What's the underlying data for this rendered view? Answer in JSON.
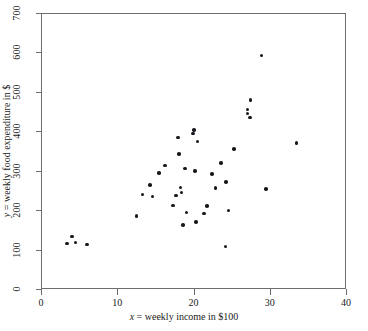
{
  "chart_data": {
    "type": "scatter",
    "title": "",
    "xlabel": "x = weekly income in $100",
    "ylabel": "y = weekly food expenditure in $",
    "xlim": [
      0,
      40
    ],
    "ylim": [
      0,
      700
    ],
    "xticks": [
      0,
      10,
      20,
      30,
      40
    ],
    "yticks": [
      0,
      100,
      200,
      300,
      400,
      500,
      600,
      700
    ],
    "xtick_labels": [
      "0",
      "10",
      "20",
      "30",
      "40"
    ],
    "ytick_labels": [
      "0",
      "100",
      "200",
      "300",
      "400",
      "500",
      "600",
      "700"
    ],
    "grid": false,
    "legend": null,
    "marker": "filled-circle",
    "marker_color": "#16181c",
    "frame_color": "#6d6d6d",
    "points": [
      {
        "x": 3.4,
        "y": 115
      },
      {
        "x": 4.1,
        "y": 133
      },
      {
        "x": 4.5,
        "y": 118
      },
      {
        "x": 6.0,
        "y": 113
      },
      {
        "x": 12.5,
        "y": 185
      },
      {
        "x": 13.3,
        "y": 240
      },
      {
        "x": 14.3,
        "y": 264
      },
      {
        "x": 14.6,
        "y": 235
      },
      {
        "x": 15.5,
        "y": 294
      },
      {
        "x": 16.3,
        "y": 313
      },
      {
        "x": 17.3,
        "y": 212
      },
      {
        "x": 17.7,
        "y": 237
      },
      {
        "x": 18.0,
        "y": 384
      },
      {
        "x": 18.1,
        "y": 342
      },
      {
        "x": 18.3,
        "y": 257
      },
      {
        "x": 18.4,
        "y": 245
      },
      {
        "x": 18.6,
        "y": 163
      },
      {
        "x": 18.9,
        "y": 306
      },
      {
        "x": 19.1,
        "y": 194
      },
      {
        "x": 19.9,
        "y": 394
      },
      {
        "x": 20.1,
        "y": 404
      },
      {
        "x": 20.2,
        "y": 300
      },
      {
        "x": 20.3,
        "y": 170
      },
      {
        "x": 20.5,
        "y": 374
      },
      {
        "x": 21.4,
        "y": 192
      },
      {
        "x": 21.8,
        "y": 211
      },
      {
        "x": 22.4,
        "y": 291
      },
      {
        "x": 22.9,
        "y": 256
      },
      {
        "x": 23.6,
        "y": 320
      },
      {
        "x": 24.2,
        "y": 108
      },
      {
        "x": 24.3,
        "y": 272
      },
      {
        "x": 24.6,
        "y": 199
      },
      {
        "x": 25.3,
        "y": 355
      },
      {
        "x": 27.1,
        "y": 455
      },
      {
        "x": 27.1,
        "y": 445
      },
      {
        "x": 27.4,
        "y": 435
      },
      {
        "x": 27.5,
        "y": 479
      },
      {
        "x": 28.9,
        "y": 592
      },
      {
        "x": 29.5,
        "y": 253
      },
      {
        "x": 33.5,
        "y": 371
      }
    ]
  }
}
